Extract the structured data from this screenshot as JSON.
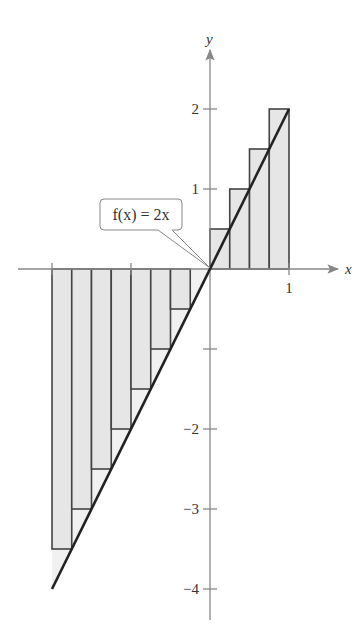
{
  "chart_data": {
    "type": "bar",
    "title": "",
    "xlabel": "x",
    "ylabel": "y",
    "function_label": "f(x) = 2x",
    "function": {
      "expr": "2x",
      "x_range": [
        -2,
        1
      ]
    },
    "xlim": [
      -2.2,
      1.6
    ],
    "ylim": [
      -4.3,
      2.7
    ],
    "grid": false,
    "x_ticks": [
      {
        "value": -2,
        "label": ""
      },
      {
        "value": -1,
        "label": ""
      },
      {
        "value": 1,
        "label": "1"
      }
    ],
    "y_ticks": [
      {
        "value": 2,
        "label": "2"
      },
      {
        "value": 1,
        "label": "1"
      },
      {
        "value": -1,
        "label": ""
      },
      {
        "value": -2,
        "label": "−2"
      },
      {
        "value": -3,
        "label": "−3"
      },
      {
        "value": -4,
        "label": "−4"
      }
    ],
    "rectangle_width": 0.25,
    "rectangles": [
      {
        "x0": -2.0,
        "x1": -1.75,
        "height": -3.5
      },
      {
        "x0": -1.75,
        "x1": -1.5,
        "height": -3.0
      },
      {
        "x0": -1.5,
        "x1": -1.25,
        "height": -2.5
      },
      {
        "x0": -1.25,
        "x1": -1.0,
        "height": -2.0
      },
      {
        "x0": -1.0,
        "x1": -0.75,
        "height": -1.5
      },
      {
        "x0": -0.75,
        "x1": -0.5,
        "height": -1.0
      },
      {
        "x0": -0.5,
        "x1": -0.25,
        "height": -0.5
      },
      {
        "x0": -0.25,
        "x1": 0.0,
        "height": 0.0
      },
      {
        "x0": 0.0,
        "x1": 0.25,
        "height": 0.5
      },
      {
        "x0": 0.25,
        "x1": 0.5,
        "height": 1.0
      },
      {
        "x0": 0.5,
        "x1": 0.75,
        "height": 1.5
      },
      {
        "x0": 0.75,
        "x1": 1.0,
        "height": 2.0
      }
    ],
    "colors": {
      "rect_fill": "#e6e6e6",
      "rect_stroke": "#444444",
      "line": "#222222",
      "axis": "#888888"
    }
  }
}
